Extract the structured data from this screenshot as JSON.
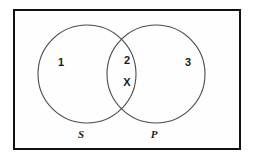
{
  "diagram": {
    "type": "venn-two-set",
    "frame": {
      "border_color": "#111111",
      "background": "#fefefe"
    },
    "stroke_color": "#4a4a4a",
    "text_color": "#1a1a1a",
    "circles": [
      {
        "name": "S",
        "label": "S",
        "cx": 87,
        "cy": 74,
        "r": 49
      },
      {
        "name": "P",
        "label": "P",
        "cx": 156,
        "cy": 74,
        "r": 49
      }
    ],
    "regions": [
      {
        "id": "region-1",
        "label": "1",
        "meaning": "S only"
      },
      {
        "id": "region-2",
        "label": "2",
        "meaning": "S and P"
      },
      {
        "id": "region-3",
        "label": "3",
        "meaning": "P only"
      }
    ],
    "marks": [
      {
        "id": "x-mark",
        "label": "X",
        "region": "region-2"
      }
    ],
    "set_labels": {
      "left": "S",
      "right": "P"
    }
  }
}
